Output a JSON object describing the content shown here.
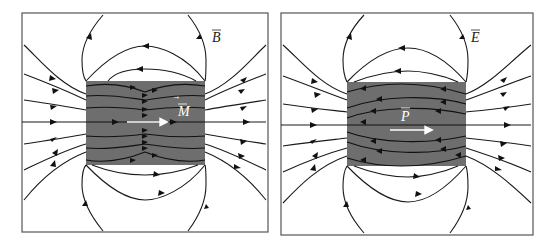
{
  "panels": [
    {
      "id": "magnet",
      "field_label": "B",
      "vector_label": "M",
      "field_description": "Magnetic field lines of a uniformly magnetized block",
      "box_color": "#6e6e6e",
      "vector_color": "#ffffff",
      "field_label_color": "#222222"
    },
    {
      "id": "electret",
      "field_label": "E",
      "vector_label": "P",
      "field_description": "Electric field lines of a uniformly polarized block",
      "box_color": "#6e6e6e",
      "vector_color": "#ffffff",
      "field_label_color": "#222222"
    }
  ],
  "colors": {
    "frame": "#555555",
    "field_line": "#1a1a1a",
    "background": "#ffffff"
  }
}
